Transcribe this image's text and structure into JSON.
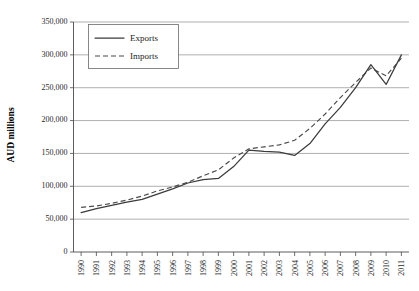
{
  "chart_data": {
    "type": "line",
    "title": "",
    "xlabel": "",
    "ylabel": "AUD millions",
    "ylim": [
      0,
      350000
    ],
    "ytick_labels": [
      "0",
      "50,000",
      "100,000",
      "150,000",
      "200,000",
      "250,000",
      "300,000",
      "350,000"
    ],
    "ytick_values": [
      0,
      50000,
      100000,
      150000,
      200000,
      250000,
      300000,
      350000
    ],
    "grid": true,
    "legend_position": "top-left",
    "categories": [
      "1990",
      "1991",
      "1992",
      "1993",
      "1994",
      "1995",
      "1996",
      "1997",
      "1998",
      "1999",
      "2000",
      "2001",
      "2002",
      "2003",
      "2004",
      "2005",
      "2006",
      "2007",
      "2008",
      "2009",
      "2010",
      "2011"
    ],
    "series": [
      {
        "name": "Exports",
        "style": "solid",
        "values": [
          60000,
          66000,
          71000,
          76000,
          80000,
          88000,
          96000,
          105000,
          110000,
          112000,
          130000,
          155000,
          153000,
          152000,
          147000,
          165000,
          195000,
          220000,
          250000,
          285000,
          255000,
          300000
        ]
      },
      {
        "name": "Imports",
        "style": "dashed",
        "values": [
          68000,
          70000,
          74000,
          79000,
          85000,
          93000,
          99000,
          106000,
          116000,
          125000,
          143000,
          157000,
          160000,
          163000,
          170000,
          188000,
          210000,
          235000,
          258000,
          280000,
          268000,
          295000
        ]
      }
    ]
  },
  "legend": {
    "entries": [
      {
        "label": "Exports"
      },
      {
        "label": "Imports"
      }
    ]
  },
  "axes": {
    "y_title": "AUD millions"
  }
}
